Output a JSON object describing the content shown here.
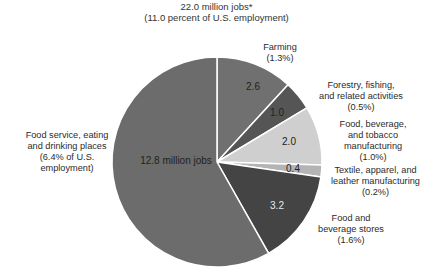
{
  "title": {
    "line1": "22.0 million jobs*",
    "line2": "(11.0 percent of U.S. employment)"
  },
  "chart_data": {
    "type": "pie",
    "title": "22.0 million jobs* (11.0 percent of U.S. employment)",
    "unit": "million jobs",
    "start_angle": "12 o'clock, clockwise",
    "total": 22.0,
    "slices": [
      {
        "label": "Farming",
        "value": 2.6,
        "share": "1.3%",
        "value_label": "2.6",
        "color": "#707070"
      },
      {
        "label": "Forestry, fishing, and related activities",
        "value": 1.0,
        "share": "0.5%",
        "value_label": "1.0",
        "color": "#555555"
      },
      {
        "label": "Food, beverage, and tobacco manufacturing",
        "value": 2.0,
        "share": "1.0%",
        "value_label": "2.0",
        "color": "#cfcfcf"
      },
      {
        "label": "Textile, apparel, and leather manufacturing",
        "value": 0.4,
        "share": "0.2%",
        "value_label": "0.4",
        "color": "#b4b4b4"
      },
      {
        "label": "Food and beverage stores",
        "value": 3.2,
        "share": "1.6%",
        "value_label": "3.2",
        "color": "#444444"
      },
      {
        "label": "Food service, eating and drinking places",
        "value": 12.8,
        "share": "6.4% of U.S. employment",
        "value_label": "12.8 million jobs",
        "color": "#6c6c6c"
      }
    ]
  },
  "labels": {
    "farming": {
      "line1": "Farming",
      "line2": "(1.3%)"
    },
    "forestry": {
      "line1": "Forestry, fishing,",
      "line2": "and related activities",
      "line3": "(0.5%)"
    },
    "foodbev": {
      "line1": "Food, beverage,",
      "line2": "and tobacco",
      "line3": "manufacturing",
      "line4": "(1.0%)"
    },
    "textile": {
      "line1": "Textile, apparel, and",
      "line2": "leather manufacturing",
      "line3": "(0.2%)"
    },
    "stores": {
      "line1": "Food and",
      "line2": "beverage stores",
      "line3": "(1.6%)"
    },
    "service": {
      "line1": "Food service, eating",
      "line2": "and drinking places",
      "line3": "(6.4% of U.S.",
      "line4": "employment)"
    }
  },
  "values": {
    "farming": "2.6",
    "forestry": "1.0",
    "foodbev": "2.0",
    "textile": "0.4",
    "stores": "3.2",
    "service": "12.8 million jobs"
  }
}
